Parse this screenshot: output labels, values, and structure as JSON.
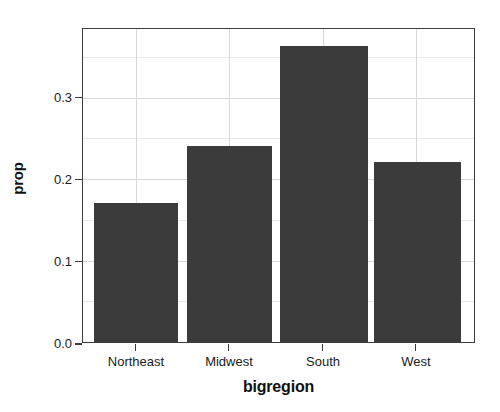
{
  "chart_data": {
    "type": "bar",
    "title": "",
    "subtitle": "",
    "xlabel": "bigregion",
    "ylabel": "prop",
    "categories": [
      "Northeast",
      "Midwest",
      "South",
      "West"
    ],
    "values": [
      0.171,
      0.241,
      0.363,
      0.221
    ],
    "series": [
      {
        "name": "prop",
        "values": [
          0.171,
          0.241,
          0.363,
          0.221
        ]
      }
    ],
    "ylim": [
      0.0,
      0.384
    ],
    "ytick_labels": [
      "0.0",
      "0.1",
      "0.2",
      "0.3"
    ],
    "ytick_values": [
      0.0,
      0.1,
      0.2,
      0.3
    ],
    "yminor_values": [
      0.05,
      0.15,
      0.25,
      0.35
    ],
    "xtick_labels": [
      "Northeast",
      "Midwest",
      "South",
      "West"
    ],
    "grid": true,
    "grid_axis": "both",
    "legend": false,
    "legend_position": "none",
    "bar_color": "#3b3b3b",
    "panel_border_color": "#3c3c3c",
    "gridline_color": "#d8d8d8",
    "minor_gridline_color": "#eaeaea",
    "background_color": "#ffffff",
    "annotations": []
  }
}
